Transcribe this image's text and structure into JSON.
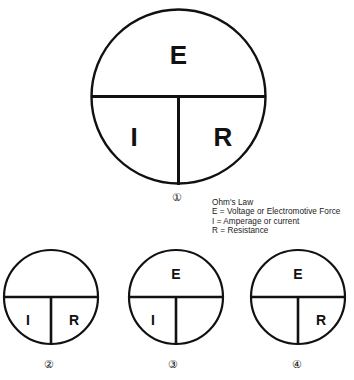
{
  "figure": {
    "stroke_color": "#111111",
    "background_color": "#ffffff",
    "shade_color": "#a8a8a8"
  },
  "legend": {
    "heading": "Ohm's Law",
    "line_e": "E = Voltage or Electromotive Force",
    "line_i": "I = Amperage or current",
    "line_r": "R = Resistance"
  },
  "letters": {
    "e": "E",
    "i": "I",
    "r": "R"
  },
  "figure_numbers": {
    "one": "①",
    "two": "②",
    "three": "③",
    "four": "④"
  },
  "wheels": [
    {
      "id": "wheel-1",
      "number": "①",
      "size": "large",
      "top_label": "E",
      "bottom_left_label": "I",
      "bottom_right_label": "R",
      "shaded_region": "none"
    },
    {
      "id": "wheel-2",
      "number": "②",
      "size": "small",
      "top_label": "",
      "bottom_left_label": "I",
      "bottom_right_label": "R",
      "shaded_region": "top-half"
    },
    {
      "id": "wheel-3",
      "number": "③",
      "size": "small",
      "top_label": "E",
      "bottom_left_label": "I",
      "bottom_right_label": "",
      "shaded_region": "bottom-right"
    },
    {
      "id": "wheel-4",
      "number": "④",
      "size": "small",
      "top_label": "E",
      "bottom_left_label": "",
      "bottom_right_label": "R",
      "shaded_region": "bottom-left"
    }
  ],
  "footer": {
    "clipped_caption": ""
  }
}
